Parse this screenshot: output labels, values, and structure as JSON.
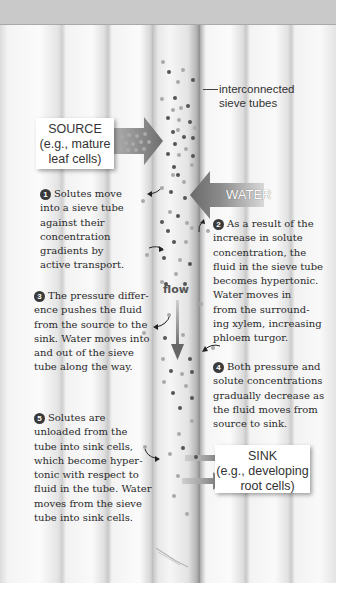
{
  "diagram": {
    "title": "",
    "labels": {
      "sieve_tubes": [
        "interconnected",
        "sieve tubes"
      ],
      "source": [
        "SOURCE",
        "(e.g., mature",
        "leaf cells)"
      ],
      "water": "WATER",
      "flow": "flow",
      "sink": [
        "SINK",
        "(e.g., developing",
        "root cells)"
      ]
    },
    "steps": [
      {
        "number": "1",
        "lines": [
          "Solutes move",
          "into a sieve tube",
          "against their",
          "concentration",
          "gradients by",
          "active transport."
        ]
      },
      {
        "number": "2",
        "lines": [
          "As a result of the",
          "increase in solute",
          "concentration, the",
          "fluid in the sieve tube",
          "becomes hypertonic.",
          "Water moves in",
          "from the surround-",
          "ing xylem, increasing",
          "phloem turgor."
        ]
      },
      {
        "number": "3",
        "lines": [
          "The pressure differ-",
          "ence pushes the fluid",
          "from the source to the",
          "sink. Water moves into",
          "and out of the sieve",
          "tube along the way."
        ]
      },
      {
        "number": "4",
        "lines": [
          "Both pressure and",
          "solute concentrations",
          "gradually decrease as",
          "the fluid moves from",
          "source to sink."
        ]
      },
      {
        "number": "5",
        "lines": [
          "Solutes are",
          "unloaded from the",
          "tube into sink cells,",
          "which become hyper-",
          "tonic with respect to",
          "fluid in the tube. Water",
          "moves from the sieve",
          "tube into sink cells."
        ]
      }
    ],
    "icons": {
      "source_arrow": "arrow-right-icon",
      "water_arrow": "arrow-left-icon",
      "flow_arrow": "arrow-down-icon",
      "sink_arrows": "arrow-right-icon",
      "solute_particles": "dot-icon"
    },
    "colors": {
      "header_band": "#c9c9c9",
      "arrow_gray": "#7d7d7d",
      "particle_dark": "#555555",
      "particle_light": "#a9a9a9",
      "badge": "#3a3a3a"
    }
  }
}
